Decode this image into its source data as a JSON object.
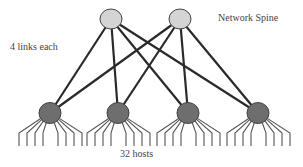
{
  "diagram": {
    "title_label": "Network Spine",
    "links_label": "4 links each",
    "hosts_label": "32 hosts",
    "colors": {
      "spine_fill": "#d4d4d4",
      "leaf_fill": "#6e6e6e",
      "link": "#2a2a2a",
      "host_line": "#555555",
      "node_stroke": "#444444"
    },
    "spine_nodes": [
      {
        "id": "spine-1",
        "cx": 111,
        "cy": 19
      },
      {
        "id": "spine-2",
        "cx": 180,
        "cy": 19
      }
    ],
    "leaf_nodes": [
      {
        "id": "leaf-1",
        "cx": 50,
        "cy": 113
      },
      {
        "id": "leaf-2",
        "cx": 118,
        "cy": 113
      },
      {
        "id": "leaf-3",
        "cx": 188,
        "cy": 113
      },
      {
        "id": "leaf-4",
        "cx": 258,
        "cy": 113
      }
    ],
    "hosts_per_leaf": 8
  }
}
